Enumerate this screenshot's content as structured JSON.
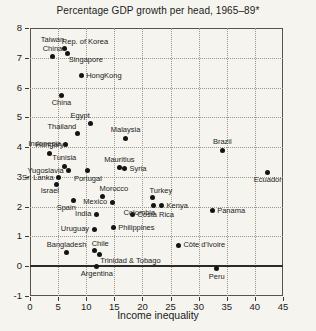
{
  "title": "Percentage GDP growth per head, 1965–89*",
  "x_axis_label": "Income inequality",
  "colors": {
    "background": "#f5f4ef",
    "ink": "#1c1c1c",
    "grid": "#9b968c",
    "dot": "#141414",
    "plot_border": "#57524b",
    "zero_line": "#2d2b28"
  },
  "chart_data": {
    "type": "scatter",
    "title": "Percentage GDP growth per head, 1965–89*",
    "xlabel": "Income inequality",
    "ylabel": "Percentage GDP growth per head, 1965–89",
    "xlim": [
      0,
      45
    ],
    "ylim": [
      -1,
      8
    ],
    "x_ticks": [
      0,
      5,
      10,
      15,
      20,
      25,
      30,
      35,
      40,
      45
    ],
    "y_ticks": [
      8,
      7,
      6,
      5,
      4,
      3,
      2,
      1,
      0,
      -1
    ],
    "grid": true,
    "points": [
      {
        "label": "Taiwan\nChina",
        "x": 4.0,
        "y": 7.05,
        "label_pos": "above"
      },
      {
        "label": "Rep. of Korea",
        "x": 6.2,
        "y": 7.3,
        "label_pos": "above-right"
      },
      {
        "label": "Singapore",
        "x": 6.7,
        "y": 7.15,
        "label_pos": "below-right"
      },
      {
        "label": "HongKong",
        "x": 9.1,
        "y": 6.4,
        "label_pos": "right"
      },
      {
        "label": "China",
        "x": 5.6,
        "y": 5.75,
        "label_pos": "below"
      },
      {
        "label": "Egypt",
        "x": 10.8,
        "y": 4.8,
        "label_pos": "above-left"
      },
      {
        "label": "Thailand",
        "x": 8.4,
        "y": 4.45,
        "label_pos": "above-left"
      },
      {
        "label": "Malaysia",
        "x": 17.0,
        "y": 4.3,
        "label_pos": "above"
      },
      {
        "label": "Indonesia",
        "x": 6.4,
        "y": 4.1,
        "label_pos": "left"
      },
      {
        "label": "Hungary",
        "x": 3.5,
        "y": 3.8,
        "label_pos": "above"
      },
      {
        "label": "Brazil",
        "x": 34.2,
        "y": 3.9,
        "label_pos": "above"
      },
      {
        "label": "Tunisia",
        "x": 6.1,
        "y": 3.35,
        "label_pos": "above"
      },
      {
        "label": "Yugoslavia",
        "x": 6.9,
        "y": 3.2,
        "label_pos": "left"
      },
      {
        "label": "Mauritius",
        "x": 15.9,
        "y": 3.3,
        "label_pos": "above"
      },
      {
        "label": "Syria",
        "x": 16.8,
        "y": 3.27,
        "label_pos": "right"
      },
      {
        "label": "Portugal",
        "x": 10.3,
        "y": 3.2,
        "label_pos": "below"
      },
      {
        "label": "Ecuador",
        "x": 42.3,
        "y": 3.15,
        "label_pos": "below"
      },
      {
        "label": "Sri Lanka",
        "x": 5.1,
        "y": 2.97,
        "label_pos": "left"
      },
      {
        "label": "Israel",
        "x": 4.8,
        "y": 2.75,
        "label_pos": "below-left"
      },
      {
        "label": "Morocco",
        "x": 12.9,
        "y": 2.35,
        "label_pos": "above-right"
      },
      {
        "label": "Turkey",
        "x": 21.8,
        "y": 2.3,
        "label_pos": "above-right"
      },
      {
        "label": "Spain",
        "x": 7.8,
        "y": 2.2,
        "label_pos": "below-left"
      },
      {
        "label": "Mexico",
        "x": 14.6,
        "y": 2.15,
        "label_pos": "left"
      },
      {
        "label": "Colombia",
        "x": 21.9,
        "y": 2.03,
        "label_pos": "below-left"
      },
      {
        "label": "Kenya",
        "x": 23.4,
        "y": 2.03,
        "label_pos": "right"
      },
      {
        "label": "Panama",
        "x": 32.4,
        "y": 1.86,
        "label_pos": "right"
      },
      {
        "label": "India",
        "x": 11.8,
        "y": 1.74,
        "label_pos": "left"
      },
      {
        "label": "Costa Rica",
        "x": 18.2,
        "y": 1.73,
        "label_pos": "right"
      },
      {
        "label": "Uruguay",
        "x": 11.4,
        "y": 1.25,
        "label_pos": "left"
      },
      {
        "label": "Philippines",
        "x": 14.8,
        "y": 1.3,
        "label_pos": "right"
      },
      {
        "label": "Côte d'Ivoire",
        "x": 26.4,
        "y": 0.7,
        "label_pos": "right"
      },
      {
        "label": "Bangladesh",
        "x": 6.5,
        "y": 0.46,
        "label_pos": "above"
      },
      {
        "label": "Chile",
        "x": 11.5,
        "y": 0.52,
        "label_pos": "above-right"
      },
      {
        "label": "Trinidad & Tobago",
        "x": 12.3,
        "y": 0.41,
        "label_pos": "below-right"
      },
      {
        "label": "Argentina",
        "x": 11.9,
        "y": 0.0,
        "label_pos": "below"
      },
      {
        "label": "Peru",
        "x": 33.2,
        "y": -0.08,
        "label_pos": "below"
      }
    ]
  }
}
